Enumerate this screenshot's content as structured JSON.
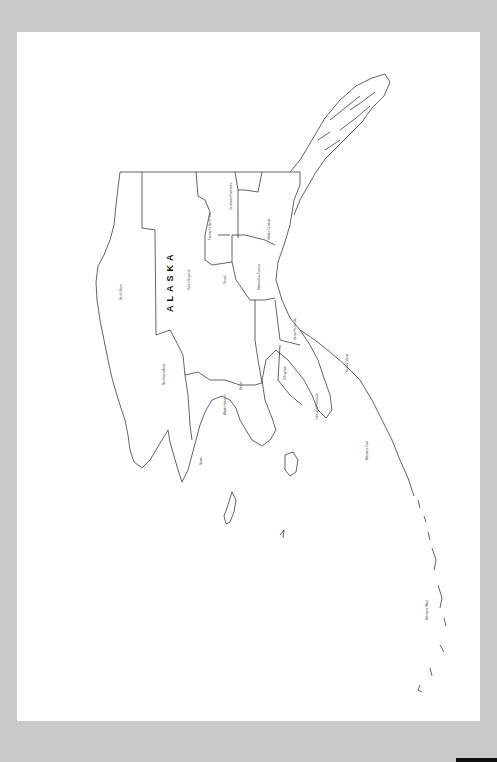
{
  "map": {
    "title": "ALASKA",
    "orientation": "rotated 90° counter-clockwise",
    "colors": {
      "background": "#c9c9c9",
      "page": "#ffffff",
      "outline": "#222222"
    },
    "labels": [
      {
        "id": "north-slope",
        "text": "North Slope"
      },
      {
        "id": "northwest-arctic",
        "text": "Northwest Arctic"
      },
      {
        "id": "yukon-koyukuk",
        "text": "Yukon-Koyukuk"
      },
      {
        "id": "fairbanks-north-star",
        "text": "Fairbanks North Star"
      },
      {
        "id": "southeast-fairbanks",
        "text": "Southeast Fairbanks"
      },
      {
        "id": "valdez-cordova",
        "text": "Valdez-Cordova"
      },
      {
        "id": "denali",
        "text": "Denali"
      },
      {
        "id": "matanuska-susitna",
        "text": "Matanuska-Susitna"
      },
      {
        "id": "nome",
        "text": "Nome"
      },
      {
        "id": "wade-hampton",
        "text": "Wade Hampton"
      },
      {
        "id": "bethel",
        "text": "Bethel"
      },
      {
        "id": "dillingham",
        "text": "Dillingham"
      },
      {
        "id": "kenai-peninsula",
        "text": "Kenai Peninsula"
      },
      {
        "id": "kodiak-island",
        "text": "Kodiak Island"
      },
      {
        "id": "lake-peninsula",
        "text": "Lake and Peninsula"
      },
      {
        "id": "aleutians-east",
        "text": "Aleutians East"
      },
      {
        "id": "aleutians-west",
        "text": "Aleutians West"
      }
    ]
  }
}
